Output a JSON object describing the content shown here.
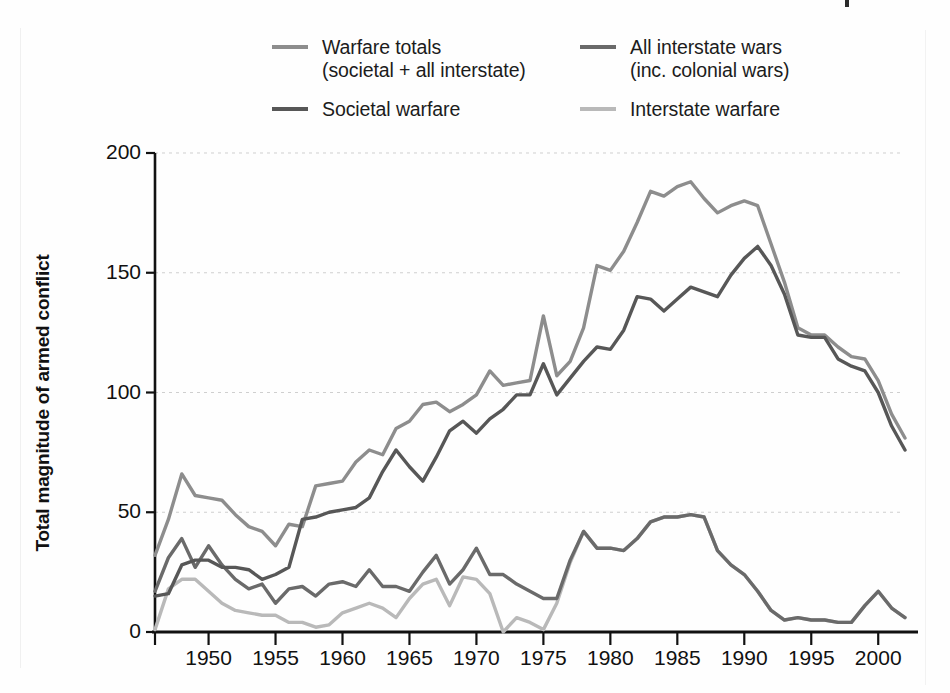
{
  "figure": {
    "background": "#fefefe"
  },
  "legend": {
    "position": "top",
    "items": [
      {
        "label": "Warfare totals\n(societal + all interstate)",
        "color": "#8d8d8d",
        "key": "warfare_totals"
      },
      {
        "label": "All interstate wars\n(inc. colonial wars)",
        "color": "#6a6a6a",
        "key": "all_interstate_wars"
      },
      {
        "label": "Societal warfare",
        "color": "#575757",
        "key": "societal_warfare"
      },
      {
        "label": "Interstate warfare",
        "color": "#b9b9b9",
        "key": "interstate_warfare"
      }
    ]
  },
  "axes": {
    "ylabel": "Total magnitude of armed conflict",
    "xlabel": "",
    "yticks": [
      "0",
      "50",
      "100",
      "150",
      "200"
    ],
    "xticks": [
      "1950",
      "1955",
      "1960",
      "1965",
      "1970",
      "1975",
      "1980",
      "1985",
      "1990",
      "1995",
      "2000"
    ]
  },
  "chart_data": {
    "type": "line",
    "title": "",
    "xlabel": "",
    "ylabel": "Total magnitude of armed conflict",
    "xlim": [
      1946,
      2002
    ],
    "ylim": [
      0,
      200
    ],
    "grid": "horizontal-dotted",
    "legend_position": "top",
    "x": [
      1946,
      1947,
      1948,
      1949,
      1950,
      1951,
      1952,
      1953,
      1954,
      1955,
      1956,
      1957,
      1958,
      1959,
      1960,
      1961,
      1962,
      1963,
      1964,
      1965,
      1966,
      1967,
      1968,
      1969,
      1970,
      1971,
      1972,
      1973,
      1974,
      1975,
      1976,
      1977,
      1978,
      1979,
      1980,
      1981,
      1982,
      1983,
      1984,
      1985,
      1986,
      1987,
      1988,
      1989,
      1990,
      1991,
      1992,
      1993,
      1994,
      1995,
      1996,
      1997,
      1998,
      1999,
      2000,
      2001,
      2002
    ],
    "series": [
      {
        "name": "Warfare totals (societal + all interstate)",
        "color": "#8d8d8d",
        "values": [
          32,
          47,
          66,
          57,
          56,
          55,
          49,
          44,
          42,
          36,
          45,
          44,
          61,
          62,
          63,
          71,
          76,
          74,
          85,
          88,
          95,
          96,
          92,
          95,
          99,
          109,
          103,
          104,
          105,
          132,
          107,
          113,
          127,
          153,
          151,
          159,
          171,
          184,
          182,
          186,
          188,
          181,
          175,
          178,
          180,
          178,
          162,
          146,
          127,
          124,
          124,
          119,
          115,
          114,
          105,
          91,
          81
        ]
      },
      {
        "name": "Societal warfare",
        "color": "#575757",
        "values": [
          15,
          16,
          28,
          30,
          30,
          27,
          27,
          26,
          22,
          24,
          27,
          47,
          48,
          50,
          51,
          52,
          56,
          67,
          76,
          69,
          63,
          73,
          84,
          88,
          83,
          89,
          93,
          99,
          99,
          112,
          99,
          106,
          113,
          119,
          118,
          126,
          140,
          139,
          134,
          139,
          144,
          142,
          140,
          149,
          156,
          161,
          153,
          141,
          124,
          123,
          123,
          114,
          111,
          109,
          100,
          86,
          76
        ]
      },
      {
        "name": "All interstate wars (inc. colonial wars)",
        "color": "#6a6a6a",
        "values": [
          17,
          31,
          39,
          27,
          36,
          28,
          22,
          18,
          20,
          12,
          18,
          19,
          15,
          20,
          21,
          19,
          26,
          19,
          19,
          17,
          25,
          32,
          20,
          26,
          35,
          24,
          24,
          20,
          17,
          14,
          14,
          30,
          42,
          35,
          35,
          34,
          39,
          46,
          48,
          48,
          49,
          48,
          34,
          28,
          24,
          17,
          9,
          5,
          6,
          5,
          5,
          4,
          4,
          11,
          17,
          10,
          6
        ]
      },
      {
        "name": "Interstate warfare",
        "color": "#b9b9b9",
        "values": [
          1,
          18,
          22,
          22,
          17,
          12,
          9,
          8,
          7,
          7,
          4,
          4,
          2,
          3,
          8,
          10,
          12,
          10,
          6,
          14,
          20,
          22,
          11,
          23,
          22,
          16,
          0,
          6,
          4,
          1,
          12,
          29,
          42,
          35,
          35,
          34,
          39,
          46,
          48,
          48,
          49,
          48,
          34,
          28,
          24,
          17,
          9,
          5,
          6,
          5,
          5,
          4,
          4,
          11,
          17,
          10,
          6
        ]
      }
    ]
  }
}
